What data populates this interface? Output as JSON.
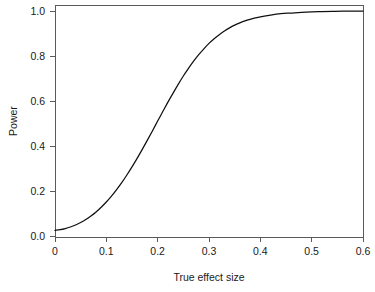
{
  "figure": {
    "background_color": "#ffffff",
    "plot_area_color": "#ffffff",
    "axis_color": "#5a5a5a",
    "curve_color": "#101010"
  },
  "chart_data": {
    "type": "line",
    "title": "",
    "xlabel": "True effect size",
    "ylabel": "Power",
    "xlim": [
      0,
      0.6
    ],
    "ylim": [
      0,
      1
    ],
    "grid": false,
    "legend": false,
    "legend_position": "none",
    "xticks": [
      0,
      0.1,
      0.2,
      0.3,
      0.4,
      0.5,
      0.6
    ],
    "xticklabels": [
      "0",
      "0.1",
      "0.2",
      "0.3",
      "0.4",
      "0.5",
      "0.6"
    ],
    "yticks": [
      0.0,
      0.2,
      0.4,
      0.6,
      0.8,
      1.0
    ],
    "yticklabels": [
      "0.0",
      "0.2",
      "0.4",
      "0.6",
      "0.8",
      "1.0"
    ],
    "series": [
      {
        "name": "Power curve",
        "color": "#101010",
        "x": [
          0.0,
          0.01,
          0.02,
          0.03,
          0.04,
          0.05,
          0.06,
          0.07,
          0.08,
          0.09,
          0.1,
          0.11,
          0.12,
          0.13,
          0.14,
          0.15,
          0.16,
          0.17,
          0.18,
          0.19,
          0.2,
          0.21,
          0.22,
          0.23,
          0.24,
          0.25,
          0.26,
          0.27,
          0.28,
          0.29,
          0.3,
          0.31,
          0.32,
          0.33,
          0.34,
          0.35,
          0.36,
          0.37,
          0.38,
          0.39,
          0.4,
          0.42,
          0.44,
          0.46,
          0.48,
          0.5,
          0.52,
          0.54,
          0.56,
          0.58,
          0.6
        ],
        "y": [
          0.025,
          0.028,
          0.033,
          0.04,
          0.049,
          0.06,
          0.073,
          0.089,
          0.107,
          0.128,
          0.151,
          0.177,
          0.206,
          0.237,
          0.271,
          0.307,
          0.345,
          0.385,
          0.426,
          0.468,
          0.511,
          0.553,
          0.595,
          0.635,
          0.674,
          0.711,
          0.745,
          0.777,
          0.806,
          0.832,
          0.856,
          0.877,
          0.895,
          0.911,
          0.925,
          0.937,
          0.947,
          0.956,
          0.963,
          0.969,
          0.974,
          0.982,
          0.988,
          0.991,
          0.994,
          0.996,
          0.997,
          0.998,
          0.999,
          0.999,
          0.999
        ]
      }
    ]
  }
}
